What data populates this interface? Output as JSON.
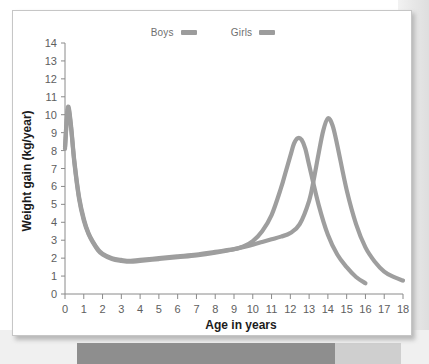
{
  "figure": {
    "legend": {
      "position": "top-center",
      "entries": [
        {
          "label": "Boys",
          "color": "#9c9c9c"
        },
        {
          "label": "Girls",
          "color": "#9c9c9c"
        }
      ]
    }
  },
  "chart_data": {
    "type": "line",
    "title": "",
    "xlabel": "Age in years",
    "ylabel": "Weight gain (kg/year)",
    "xlim": [
      0,
      18
    ],
    "ylim": [
      0,
      14
    ],
    "xticks": [
      0,
      1,
      2,
      3,
      4,
      5,
      6,
      7,
      8,
      9,
      10,
      11,
      12,
      13,
      14,
      15,
      16,
      17,
      18
    ],
    "yticks": [
      0,
      1,
      2,
      3,
      4,
      5,
      6,
      7,
      8,
      9,
      10,
      11,
      12,
      13,
      14
    ],
    "xtick_labels": [
      "0",
      "1",
      "2",
      "3",
      "4",
      "5",
      "6",
      "7",
      "8",
      "9",
      "10",
      "11",
      "12",
      "13",
      "14",
      "15",
      "16",
      "17",
      "18"
    ],
    "ytick_labels": [
      "0",
      "1",
      "2",
      "3",
      "4",
      "5",
      "6",
      "7",
      "8",
      "9",
      "10",
      "11",
      "12",
      "13",
      "14"
    ],
    "grid": false,
    "legend_position": "top-center",
    "line_color": "#9e9e9e",
    "series": [
      {
        "name": "Boys",
        "color": "#9e9e9e",
        "peak_age": 14.0,
        "peak_value": 9.8,
        "x": [
          0.0,
          0.15,
          0.3,
          0.5,
          0.75,
          1.0,
          1.25,
          1.5,
          1.75,
          2.0,
          2.5,
          3.0,
          3.5,
          4.0,
          5.0,
          6.0,
          7.0,
          8.0,
          9.0,
          10.0,
          10.5,
          11.0,
          11.5,
          12.0,
          12.5,
          13.0,
          13.25,
          13.5,
          13.75,
          14.0,
          14.25,
          14.5,
          15.0,
          15.5,
          16.0,
          16.5,
          17.0,
          17.5,
          18.0
        ],
        "y": [
          8.2,
          10.4,
          9.6,
          7.4,
          5.4,
          4.2,
          3.4,
          2.9,
          2.5,
          2.25,
          2.0,
          1.9,
          1.85,
          1.9,
          2.0,
          2.1,
          2.2,
          2.35,
          2.5,
          2.75,
          2.9,
          3.05,
          3.2,
          3.4,
          3.9,
          5.2,
          6.4,
          7.8,
          9.1,
          9.8,
          9.4,
          8.3,
          5.8,
          3.9,
          2.6,
          1.8,
          1.25,
          0.95,
          0.75
        ]
      },
      {
        "name": "Girls",
        "color": "#9e9e9e",
        "peak_age": 12.4,
        "peak_value": 8.7,
        "x": [
          0.0,
          0.15,
          0.3,
          0.5,
          0.75,
          1.0,
          1.25,
          1.5,
          1.75,
          2.0,
          2.5,
          3.0,
          3.5,
          4.0,
          5.0,
          6.0,
          7.0,
          8.0,
          9.0,
          9.5,
          10.0,
          10.5,
          11.0,
          11.5,
          11.75,
          12.0,
          12.2,
          12.4,
          12.6,
          12.8,
          13.0,
          13.5,
          14.0,
          14.5,
          15.0,
          15.5,
          16.0
        ],
        "y": [
          8.1,
          10.3,
          9.5,
          7.3,
          5.3,
          4.1,
          3.35,
          2.85,
          2.45,
          2.2,
          1.95,
          1.85,
          1.8,
          1.85,
          1.95,
          2.05,
          2.15,
          2.3,
          2.5,
          2.65,
          2.95,
          3.5,
          4.4,
          5.9,
          6.8,
          7.7,
          8.4,
          8.7,
          8.6,
          8.1,
          7.2,
          5.0,
          3.3,
          2.2,
          1.5,
          0.95,
          0.6
        ]
      }
    ]
  }
}
